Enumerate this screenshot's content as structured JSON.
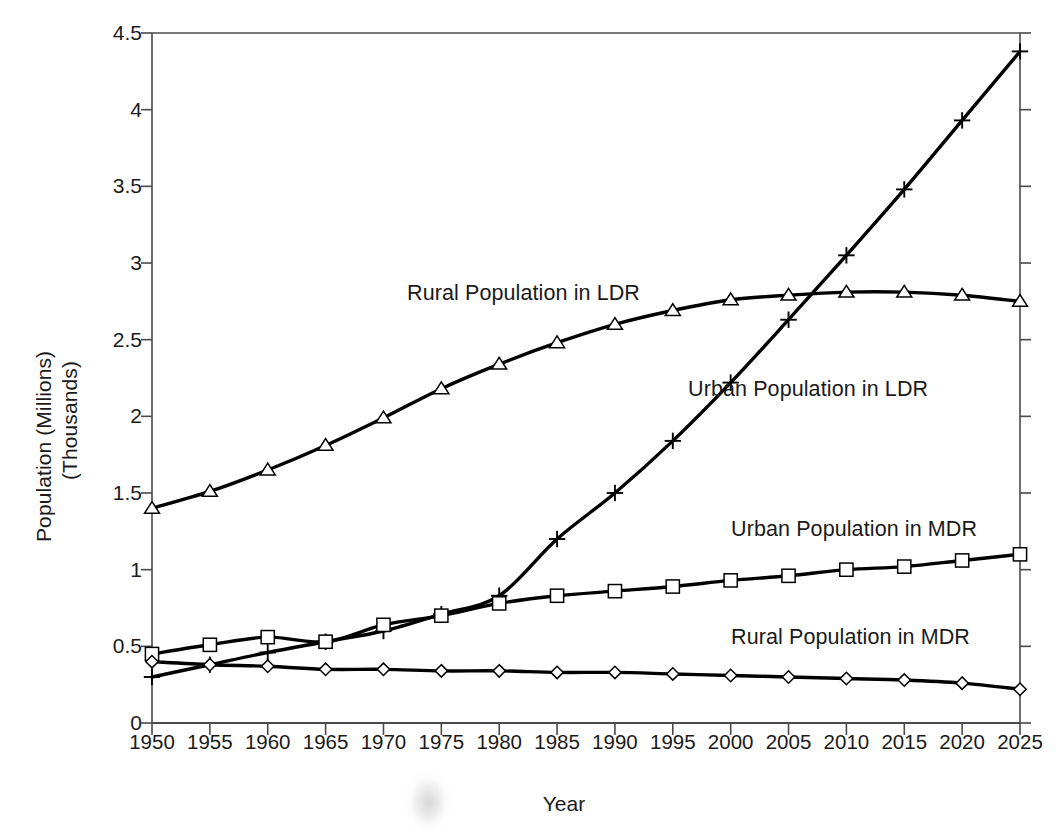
{
  "chart_data": {
    "type": "line",
    "title": "",
    "xlabel": "Year",
    "ylabel": "Population (Millions)\n(Thousands)",
    "ylabel_line1": "Population (Millions)",
    "ylabel_line2": "(Thousands)",
    "xlim": [
      1950,
      2025
    ],
    "ylim": [
      0,
      4.5
    ],
    "ytick_labels": [
      "0",
      "0.5",
      "1",
      "1.5",
      "2",
      "2.5",
      "3",
      "3.5",
      "4",
      "4.5"
    ],
    "ytick_values": [
      0,
      0.5,
      1,
      1.5,
      2,
      2.5,
      3,
      3.5,
      4,
      4.5
    ],
    "grid": false,
    "legend_position": "inline-annotations",
    "x": [
      1950,
      1955,
      1960,
      1965,
      1970,
      1975,
      1980,
      1985,
      1990,
      1995,
      2000,
      2005,
      2010,
      2015,
      2020,
      2025
    ],
    "categories": [
      "1950",
      "1955",
      "1960",
      "1965",
      "1970",
      "1975",
      "1980",
      "1985",
      "1990",
      "1995",
      "2000",
      "2005",
      "2010",
      "2015",
      "2020",
      "2025"
    ],
    "series": [
      {
        "name": "Rural Population in LDR",
        "marker": "triangle",
        "values": [
          1.4,
          1.51,
          1.65,
          1.81,
          1.99,
          2.18,
          2.34,
          2.48,
          2.6,
          2.69,
          2.76,
          2.79,
          2.81,
          2.81,
          2.79,
          2.75
        ]
      },
      {
        "name": "Urban Population in LDR",
        "marker": "plus",
        "values": [
          0.3,
          0.38,
          0.46,
          0.53,
          0.6,
          0.71,
          0.83,
          1.2,
          1.5,
          1.84,
          2.22,
          2.63,
          3.05,
          3.48,
          3.93,
          4.38
        ]
      },
      {
        "name": "Urban Population in MDR",
        "marker": "square",
        "values": [
          0.45,
          0.51,
          0.56,
          0.53,
          0.64,
          0.7,
          0.78,
          0.83,
          0.86,
          0.89,
          0.93,
          0.96,
          1.0,
          1.02,
          1.06,
          1.1
        ]
      },
      {
        "name": "Rural Population in MDR",
        "marker": "diamond",
        "values": [
          0.4,
          0.38,
          0.37,
          0.35,
          0.35,
          0.34,
          0.34,
          0.33,
          0.33,
          0.32,
          0.31,
          0.3,
          0.29,
          0.28,
          0.26,
          0.22
        ]
      }
    ],
    "annotations": [
      {
        "text": "Rural Population in LDR",
        "series": "Rural Population in LDR"
      },
      {
        "text": "Urban Population in LDR",
        "series": "Urban Population in LDR"
      },
      {
        "text": "Urban Population in MDR",
        "series": "Urban Population in MDR"
      },
      {
        "text": "Rural Population in MDR",
        "series": "Rural Population in MDR"
      }
    ],
    "colors": {
      "line": "#000000",
      "marker_fill": "#ffffff",
      "axis": "#4a4a4a",
      "background": "#ffffff"
    }
  }
}
